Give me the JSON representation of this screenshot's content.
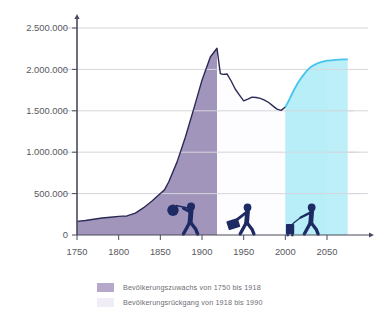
{
  "chart_data": {
    "type": "area",
    "title": "",
    "subtitle": "",
    "xlabel": "",
    "ylabel": "",
    "xlim": [
      1750,
      2075
    ],
    "ylim": [
      0,
      2600000
    ],
    "grid": true,
    "x_ticks": [
      1750,
      1800,
      1850,
      1900,
      1950,
      2000,
      2050
    ],
    "x_tick_labels": [
      "1750",
      "1800",
      "1850",
      "1900",
      "1950",
      "2000",
      "2050"
    ],
    "y_ticks": [
      0,
      500000,
      1000000,
      1500000,
      2000000,
      2500000
    ],
    "y_tick_labels": [
      "0",
      "500.000",
      "1.000.000",
      "1.500.000",
      "2.000.000",
      "2.500.000"
    ],
    "legend_position": "bottom-left",
    "series": [
      {
        "name": "Bevölkerungsentwicklung 1750-2000",
        "color": "#2b2a55",
        "fill_growth": "#b5a8cb",
        "fill_decline": "#f1edf6",
        "x": [
          1750,
          1760,
          1770,
          1780,
          1790,
          1800,
          1805,
          1810,
          1820,
          1830,
          1840,
          1850,
          1855,
          1860,
          1870,
          1880,
          1890,
          1900,
          1910,
          1918,
          1922,
          1925,
          1930,
          1935,
          1940,
          1945,
          1950,
          1955,
          1960,
          1965,
          1970,
          1975,
          1980,
          1985,
          1990,
          1995,
          2000
        ],
        "y": [
          165000,
          175000,
          190000,
          205000,
          215000,
          225000,
          228000,
          230000,
          265000,
          330000,
          410000,
          500000,
          545000,
          640000,
          880000,
          1180000,
          1520000,
          1870000,
          2150000,
          2255000,
          1950000,
          1940000,
          1945000,
          1860000,
          1760000,
          1690000,
          1620000,
          1640000,
          1665000,
          1660000,
          1650000,
          1630000,
          1600000,
          1560000,
          1520000,
          1505000,
          1545000
        ]
      },
      {
        "name": "Prognose 2000-2075",
        "color": "#45c4ee",
        "fill_forecast": "#c3f0f8",
        "x": [
          2000,
          2005,
          2010,
          2015,
          2020,
          2025,
          2030,
          2035,
          2040,
          2045,
          2050,
          2055,
          2060,
          2065,
          2070,
          2075
        ],
        "y": [
          1545000,
          1640000,
          1745000,
          1835000,
          1910000,
          1975000,
          2025000,
          2055000,
          2080000,
          2095000,
          2105000,
          2110000,
          2115000,
          2118000,
          2120000,
          2122000
        ]
      }
    ],
    "bands": [
      {
        "name": "growth-band",
        "from": 1750,
        "to": 1918,
        "color": "#b5a8cb"
      },
      {
        "name": "decline-band",
        "from": 1918,
        "to": 2000,
        "color": "#f1edf6"
      },
      {
        "name": "forecast-band",
        "from": 2000,
        "to": 2050,
        "color": "#c3f0f8"
      }
    ],
    "annotations": [
      {
        "name": "emigrant-bundle-figure",
        "x": 1880,
        "label": "Auswanderer mit Bündel"
      },
      {
        "name": "traveler-suitcase-figure",
        "x": 1948,
        "label": "Reisender mit Koffer"
      },
      {
        "name": "traveler-rolling-suitcase-figure",
        "x": 2025,
        "label": "Reisender mit Rollkoffer"
      }
    ],
    "legend": [
      {
        "label": "Bevölkerungszuwachs von 1750 bis 1918",
        "color": "#b5a8cb"
      },
      {
        "label": "Bevölkerungsrückgang von 1918 bis 1990",
        "color": "#f1edf6"
      }
    ]
  },
  "colors": {
    "line_historic": "#2b2a55",
    "line_forecast": "#45c4ee",
    "fill_growth": "#b5a8cb",
    "fill_decline": "#f1edf6",
    "fill_forecast": "#c3f0f8",
    "axis": "#4a4a5e",
    "grid": "#d6d6dc",
    "tick_text": "#58585f",
    "legend_text": "#6d6d75",
    "figure": "#1d2a63",
    "background": "#ffffff"
  },
  "axis_labels": {
    "y": [
      "2.500.000",
      "2.000.000",
      "1.500.000",
      "1.000.000",
      "500.000",
      "0"
    ],
    "x": [
      "1750",
      "1800",
      "1850",
      "1900",
      "1950",
      "2000",
      "2050"
    ]
  },
  "legend": {
    "items": [
      {
        "label": "Bevölkerungszuwachs von 1750 bis 1918"
      },
      {
        "label": "Bevölkerungsrückgang von 1918 bis 1990"
      }
    ]
  }
}
